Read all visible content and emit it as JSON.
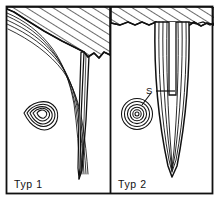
{
  "figure": {
    "title_present": false,
    "background_color": "#ffffff",
    "ink_color": "#111111",
    "width": 223,
    "height": 205
  },
  "frame": {
    "outer_border_name": "figure-outer-border",
    "divider_name": "panel-divider",
    "border_color": "#111111"
  },
  "panels": [
    {
      "id": "typ1",
      "label": "Typ 1",
      "label_name": "panel-label-typ-1",
      "hatch_region_name": "hatched-overburden-typ-1",
      "flow_lines_name": "flow-lines-typ-1",
      "crack_name": "narrow-crack-typ-1",
      "contour_cluster_name": "teardrop-contour-cluster-typ-1",
      "contour_ring_count": 5,
      "contour_shape": "teardrop"
    },
    {
      "id": "typ2",
      "label": "Typ 2",
      "label_name": "panel-label-typ-2",
      "hatch_region_name": "hatched-overburden-typ-2",
      "flow_lines_name": "flow-lines-typ-2",
      "wedge_name": "v-wedge-typ-2",
      "slot_name": "central-slot-typ-2",
      "contour_cluster_name": "concentric-contour-cluster-typ-2",
      "contour_ring_count": 6,
      "contour_shape": "concentric-circles"
    }
  ],
  "annotations": [
    {
      "text": "S",
      "name": "annotation-label-s",
      "leader_to_slot_name": "leader-line-s-to-slot",
      "leader_to_contours_name": "leader-line-s-to-contours"
    }
  ]
}
